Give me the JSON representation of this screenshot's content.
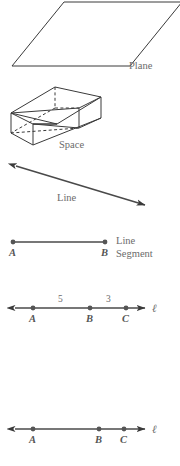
{
  "figure": {
    "title_text": "",
    "colors": {
      "stroke": "#3a3a3a",
      "axis": "#4a4a4a",
      "label": "#6b6b6b",
      "point": "#555555",
      "background": "#ffffff"
    },
    "panels": {
      "plane": {
        "caption": "Plane",
        "shape": "parallelogram",
        "vertices": "12,66 64,2 180,2 128,66"
      },
      "space": {
        "caption": "Space",
        "shape": "rectangular-prism",
        "hidden_edges": "dashed"
      },
      "line": {
        "caption": "Line",
        "shape": "double-headed-arrow",
        "from": "13,165",
        "to": "148,206"
      },
      "segment": {
        "caption_line1": "Line",
        "caption_line2": "Segment",
        "endpoints": [
          {
            "label": "A",
            "x": 13
          },
          {
            "label": "B",
            "x": 105
          }
        ]
      },
      "numberline_measured": {
        "line_name": "ℓ",
        "points": [
          {
            "label": "A",
            "x": 33
          },
          {
            "label": "B",
            "x": 90
          },
          {
            "label": "C",
            "x": 126
          }
        ],
        "measures": [
          {
            "value": "5",
            "x": 60
          },
          {
            "value": "3",
            "x": 108
          }
        ]
      },
      "numberline_plain": {
        "line_name": "ℓ",
        "points": [
          {
            "label": "A",
            "x": 33
          },
          {
            "label": "B",
            "x": 99
          },
          {
            "label": "C",
            "x": 124
          }
        ]
      }
    }
  }
}
